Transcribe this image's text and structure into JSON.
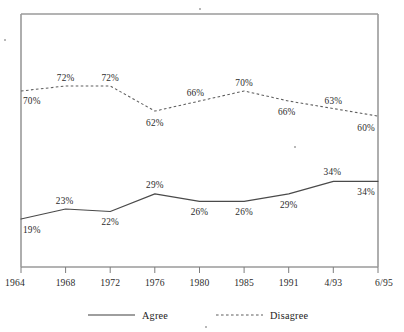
{
  "chart_data": {
    "type": "line",
    "title": "",
    "subtitle": "",
    "xlabel": "",
    "ylabel": "",
    "grid": false,
    "legend_position": "bottom",
    "ylim": [
      0,
      80
    ],
    "categories": [
      "1964",
      "1968",
      "1972",
      "1976",
      "1980",
      "1985",
      "1991",
      "4/93",
      "6/95"
    ],
    "series": [
      {
        "name": "Agree",
        "style": "solid",
        "color": "#4a4a4a",
        "values": [
          19,
          23,
          22,
          29,
          26,
          26,
          29,
          34,
          34
        ],
        "labels": [
          "19%",
          "23%",
          "22%",
          "29%",
          "26%",
          "26%",
          "29%",
          "34%",
          "34%"
        ]
      },
      {
        "name": "Disagree",
        "style": "dashed",
        "color": "#5e5e5e",
        "values": [
          70,
          72,
          72,
          62,
          66,
          70,
          66,
          63,
          60
        ],
        "labels": [
          "70%",
          "72%",
          "72%",
          "62%",
          "66%",
          "70%",
          "66%",
          "63%",
          "60%"
        ]
      }
    ]
  },
  "axis": {
    "tick_labels": [
      "1964",
      "1968",
      "1972",
      "1976",
      "1980",
      "1985",
      "1991",
      "4/93",
      "6/95"
    ]
  },
  "legend": {
    "items": [
      {
        "label": "Agree",
        "style": "solid"
      },
      {
        "label": "Disagree",
        "style": "dashed"
      }
    ]
  }
}
